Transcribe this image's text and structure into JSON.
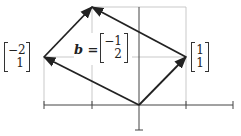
{
  "diagram": {
    "colors": {
      "grid": "#bbbbbb",
      "axis": "#444444",
      "arrow": "#222222"
    },
    "origin_px": [
      139,
      105
    ],
    "unit_px": [
      47,
      49
    ],
    "vectors": [
      {
        "name": "v1",
        "label_top": "1",
        "label_bottom": "1",
        "coords": [
          1,
          1
        ]
      },
      {
        "name": "v2",
        "label_top": "−2",
        "label_bottom": "1",
        "coords": [
          -2,
          1
        ]
      },
      {
        "name": "b",
        "label_prefix": "b =",
        "label_top": "−1",
        "label_bottom": "2",
        "coords": [
          -1,
          2
        ]
      }
    ]
  }
}
